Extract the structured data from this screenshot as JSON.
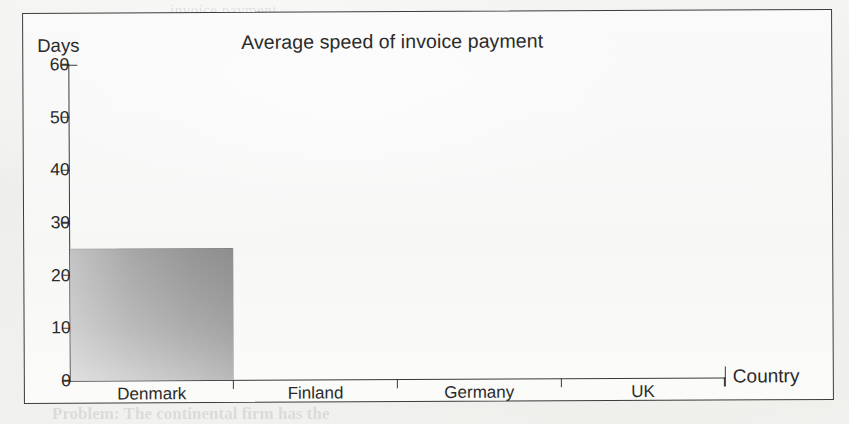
{
  "figure": {
    "frame_color": "#3c3c3c",
    "background_color": "#fafafa"
  },
  "ghost_text": {
    "line1": "invoice payment",
    "line2": "was received by the buyer or the number of",
    "line3": "invoice. Once again we do not know",
    "line4": "in the chart above, but Company X's",
    "line5": "is slower to pay than its debtors",
    "line6": "Country Case: Business and Inter",
    "line7": "Problem: The continental firm has the"
  },
  "chart_data": {
    "type": "bar",
    "title": "Average speed of invoice payment",
    "xlabel": "Country",
    "ylabel": "Days",
    "categories": [
      "Denmark",
      "Finland",
      "Germany",
      "UK"
    ],
    "values": [
      25,
      null,
      null,
      null
    ],
    "ylim": [
      0,
      60
    ],
    "yticks": [
      0,
      10,
      20,
      30,
      40,
      50,
      60
    ],
    "ytick_labels": [
      "0",
      "10",
      "20",
      "30",
      "40",
      "50",
      "60"
    ],
    "grid": false,
    "legend": null,
    "series": [
      {
        "name": "Average speed of invoice payment",
        "values": [
          25,
          null,
          null,
          null
        ],
        "color": "#b0b0b0"
      }
    ]
  }
}
